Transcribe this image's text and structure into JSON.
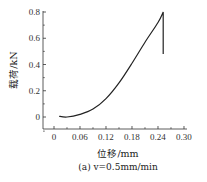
{
  "chart_data": {
    "type": "line",
    "title": "",
    "caption": "(a) v=0.5mm/min",
    "xlabel": "位移/mm",
    "ylabel": "载荷/kN",
    "xlim": [
      -0.015,
      0.3
    ],
    "ylim": [
      -0.1,
      0.82
    ],
    "xticks": [
      0,
      0.06,
      0.12,
      0.18,
      0.24,
      0.3
    ],
    "xtick_labels": [
      "0",
      "0.06",
      "0.12",
      "0.18",
      "0.24",
      "0.30"
    ],
    "yticks": [
      0,
      0.2,
      0.4,
      0.6,
      0.8
    ],
    "ytick_labels": [
      "0",
      "0.2",
      "0.4",
      "0.6",
      "0.8"
    ],
    "grid": false,
    "legend": null,
    "series": [
      {
        "name": "v=0.5mm/min",
        "color": "#222222",
        "x": [
          0.012,
          0.03,
          0.06,
          0.09,
          0.12,
          0.15,
          0.18,
          0.21,
          0.24,
          0.252,
          0.252
        ],
        "y": [
          0.005,
          0.0,
          0.02,
          0.06,
          0.14,
          0.26,
          0.41,
          0.57,
          0.72,
          0.8,
          0.48
        ]
      }
    ]
  },
  "layout": {
    "origin_px": [
      54,
      117
    ],
    "x_px_per_unit": 433.33,
    "y_px_per_unit": 131.25,
    "x_axis_y_px": 129,
    "y_axis_x_px": 43,
    "x_axis_end_px": 187,
    "y_axis_top_px": 11
  }
}
